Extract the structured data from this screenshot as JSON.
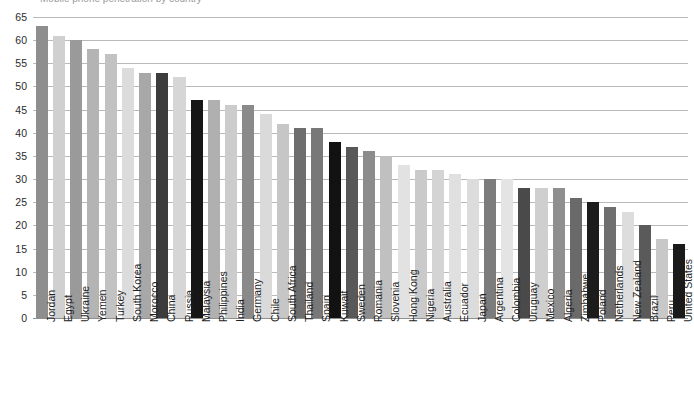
{
  "chart_title_clipped": "Mobile phone penetration by country",
  "axis": {
    "y_ticks": [
      0,
      5,
      10,
      15,
      20,
      25,
      30,
      35,
      40,
      45,
      50,
      55,
      60,
      65
    ],
    "y_min": 0,
    "y_max": 65
  },
  "chart_data": {
    "type": "bar",
    "title": "",
    "xlabel": "",
    "ylabel": "",
    "ylim": [
      0,
      65
    ],
    "grid": true,
    "legend": "none",
    "orientation": "vertical",
    "x_tick_rotation": -90,
    "categories": [
      "Jordan",
      "Egypt",
      "Ukraine",
      "Yemen",
      "Turkey",
      "South Korea",
      "Morocco",
      "China",
      "Russia",
      "Malaysia",
      "Philippines",
      "India",
      "Germany",
      "Chile",
      "South Africa",
      "Thailand",
      "Spain",
      "Kuwait",
      "Sweden",
      "Romania",
      "Slovenia",
      "Hong Kong",
      "Nigeria",
      "Australia",
      "Ecuador",
      "Japan",
      "Argentina",
      "Colombia",
      "Uruguay",
      "Mexico",
      "Algeria",
      "Zimbabwe",
      "Poland",
      "Netherlands",
      "New Zealand",
      "Brazil",
      "Peru",
      "United States"
    ],
    "values": [
      63,
      61,
      60,
      58,
      57,
      54,
      53,
      53,
      52,
      47,
      47,
      46,
      46,
      44,
      42,
      41,
      41,
      38,
      37,
      36,
      35,
      33,
      32,
      32,
      31,
      30,
      30,
      30,
      28,
      28,
      28,
      26,
      25,
      24,
      23,
      20,
      17,
      16
    ],
    "colors": [
      "#8e8e8e",
      "#d0d0d0",
      "#9a9a9a",
      "#b4b4b4",
      "#c2c2c2",
      "#dcdcdc",
      "#a8a8a8",
      "#3c3c3c",
      "#d6d6d6",
      "#161616",
      "#b0b0b0",
      "#cccccc",
      "#8a8a8a",
      "#dadada",
      "#c6c6c6",
      "#6e6e6e",
      "#787878",
      "#121212",
      "#585858",
      "#8c8c8c",
      "#c0c0c0",
      "#e2e2e2",
      "#cacaca",
      "#d4d4d4",
      "#e0e0e0",
      "#dcdcdc",
      "#7c7c7c",
      "#e4e4e4",
      "#4a4a4a",
      "#cfcfcf",
      "#8f8f8f",
      "#6a6a6a",
      "#1c1c1c",
      "#6f6f6f",
      "#dddddd",
      "#5a5a5a",
      "#c8c8c8",
      "#1a1a1a"
    ]
  }
}
